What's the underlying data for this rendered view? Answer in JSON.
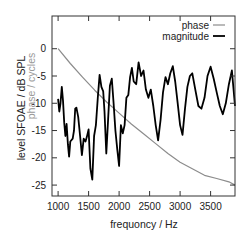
{
  "chart_data": {
    "type": "line",
    "title": "",
    "xlabel": "frequency / Hz",
    "ylabel": "level SFOAE / dB SPL",
    "ylabel2": "phase / cycles",
    "xlim": [
      900,
      3900
    ],
    "ylim": [
      -27,
      6
    ],
    "x_ticks": [
      1000,
      1500,
      2000,
      2500,
      3000,
      3500
    ],
    "x_tick_labels": [
      "1000",
      "1500",
      "2000",
      "2500",
      "3000",
      "3500"
    ],
    "y_ticks": [
      0,
      -5,
      -10,
      -15,
      -20,
      -25
    ],
    "y_tick_labels": [
      "0",
      "-5",
      "-10",
      "-15",
      "-20",
      "-25"
    ],
    "grid": false,
    "legend_position": "upper right",
    "legend": [
      "phase",
      "magnitude"
    ],
    "series": [
      {
        "name": "phase",
        "color": "#8c8c8c",
        "x": [
          1000,
          1200,
          1400,
          1600,
          1800,
          2000,
          2200,
          2400,
          2600,
          2800,
          3000,
          3200,
          3400,
          3600,
          3800,
          3900
        ],
        "values": [
          0,
          -2.7,
          -5.2,
          -7.6,
          -9.8,
          -11.8,
          -13.8,
          -15.6,
          -17.4,
          -19.2,
          -20.8,
          -22.0,
          -23.2,
          -23.8,
          -24.4,
          -25.0
        ]
      },
      {
        "name": "magnitude",
        "color": "#000000",
        "x": [
          1000,
          1020,
          1040,
          1060,
          1080,
          1100,
          1120,
          1140,
          1160,
          1180,
          1200,
          1240,
          1260,
          1280,
          1300,
          1330,
          1360,
          1390,
          1420,
          1450,
          1470,
          1500,
          1530,
          1560,
          1590,
          1620,
          1650,
          1680,
          1710,
          1740,
          1760,
          1790,
          1820,
          1850,
          1880,
          1910,
          1940,
          1970,
          2000,
          2030,
          2060,
          2090,
          2120,
          2150,
          2180,
          2210,
          2240,
          2280,
          2320,
          2360,
          2400,
          2440,
          2480,
          2520,
          2560,
          2600,
          2640,
          2680,
          2720,
          2760,
          2800,
          2840,
          2880,
          2920,
          2960,
          3000,
          3040,
          3080,
          3120,
          3160,
          3200,
          3250,
          3300,
          3350,
          3400,
          3450,
          3500,
          3550,
          3600,
          3650,
          3700,
          3750,
          3800,
          3850,
          3900
        ],
        "values": [
          -9.2,
          -11.5,
          -10.0,
          -7.0,
          -9.5,
          -13.5,
          -16.0,
          -13.8,
          -17.5,
          -19.8,
          -17.0,
          -16.5,
          -15.0,
          -11.0,
          -10.8,
          -12.5,
          -16.0,
          -19.5,
          -16.5,
          -17.0,
          -16.2,
          -14.8,
          -22.0,
          -24.0,
          -16.0,
          -14.0,
          -9.0,
          -4.8,
          -7.0,
          -7.8,
          -11.5,
          -19.2,
          -13.0,
          -6.8,
          -5.5,
          -10.0,
          -15.0,
          -18.5,
          -21.5,
          -14.0,
          -15.5,
          -14.0,
          -9.0,
          -8.5,
          -5.2,
          -3.5,
          -6.0,
          -6.5,
          -2.5,
          -5.0,
          -4.0,
          -7.5,
          -9.0,
          -7.5,
          -10.5,
          -14.0,
          -16.8,
          -13.0,
          -8.0,
          -5.2,
          -6.5,
          -4.5,
          -3.2,
          -6.0,
          -10.0,
          -14.0,
          -15.8,
          -11.0,
          -7.0,
          -5.0,
          -4.5,
          -7.5,
          -10.5,
          -11.0,
          -9.0,
          -5.0,
          -3.3,
          -5.5,
          -8.0,
          -10.5,
          -12.0,
          -10.0,
          -6.5,
          -4.0,
          -10.5
        ]
      }
    ]
  },
  "axes": {
    "xlabel": "frequoncy / Hz",
    "ylabel_main": "level SFOAE / dB SPL",
    "ylabel_secondary": "phase / cycles"
  },
  "legend": {
    "items": [
      {
        "label": "phase",
        "color": "#8c8c8c"
      },
      {
        "label": "magnitude",
        "color": "#000000"
      }
    ]
  }
}
